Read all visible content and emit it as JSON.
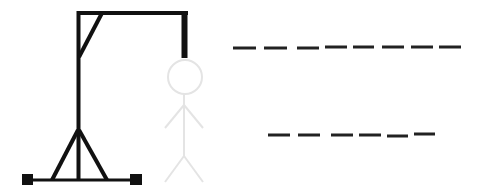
{
  "game": {
    "type": "hangman",
    "colors": {
      "gallows": "#111111",
      "figure_hidden": "#e4e4e4",
      "blanks": "#222222",
      "background": "#ffffff"
    },
    "words": [
      {
        "letters": [
          "",
          "",
          "",
          "",
          "",
          "",
          "",
          ""
        ],
        "length": 8
      },
      {
        "letters": [
          "",
          "",
          "",
          "",
          "",
          ""
        ],
        "length": 6
      }
    ],
    "figure_parts_revealed": 0,
    "figure_parts_total": 6
  }
}
